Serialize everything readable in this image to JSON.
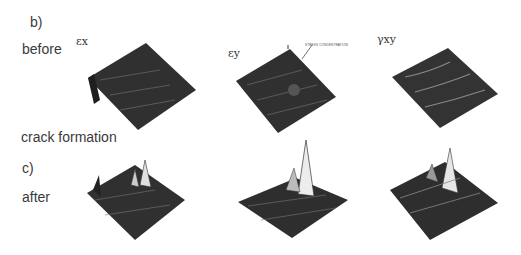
{
  "figure": {
    "row_b": {
      "panel_label": "b)",
      "state_label": "before"
    },
    "transition_label": "crack formation",
    "row_c": {
      "panel_label": "c)",
      "state_label": "after"
    },
    "columns": [
      {
        "symbol": "εx"
      },
      {
        "symbol": "εy",
        "annotation": "STRESS CONCENTRATION"
      },
      {
        "symbol": "γxy"
      }
    ],
    "colors": {
      "surface": "#2e2e2e",
      "highlight": "#e8e8e8",
      "background": "#ffffff"
    }
  }
}
